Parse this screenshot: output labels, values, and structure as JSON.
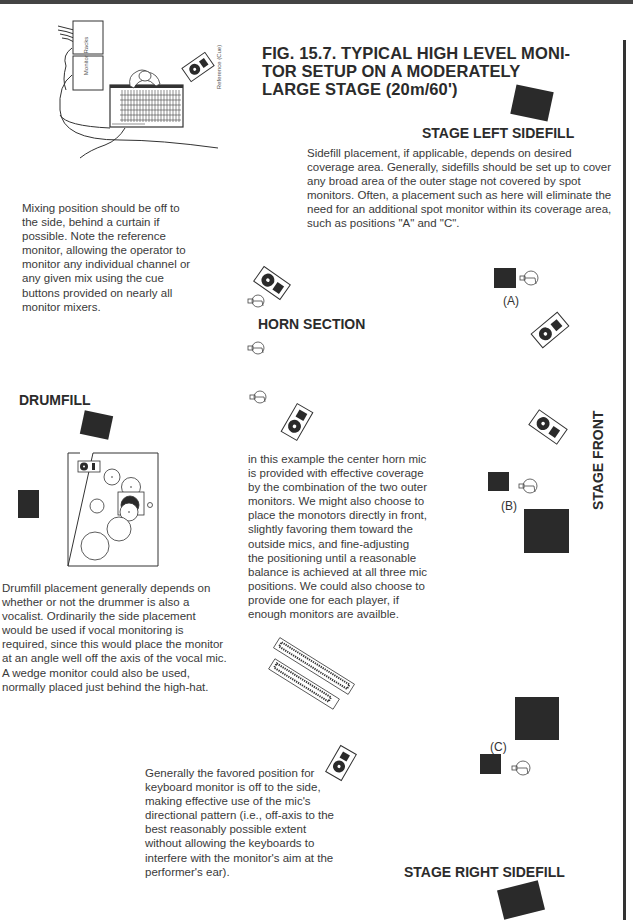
{
  "figure": {
    "title_lines": [
      "FIG. 15.7.  TYPICAL HIGH LEVEL MONI-",
      "TOR SETUP ON A MODERATELY",
      "LARGE STAGE (20m/60')"
    ]
  },
  "mix_position": {
    "rack_label": "Monitor Racks",
    "reference_label": "Reference (Cue)",
    "caption": "Mixing position should be off to the side, behind a curtain if possible.  Note the reference monitor, allowing the operator to monitor any individual channel or any given mix using the cue buttons provided on nearly all monitor mixers."
  },
  "stage_left_sidefill": {
    "label": "STAGE LEFT SIDEFILL",
    "caption": "Sidefill placement, if applicable, depends on desired coverage area.  Generally, sidefills should be set up to cover any broad area of the outer stage not covered by spot monitors.  Often, a placement such as here will eliminate the need for an additional spot monitor within its coverage area, such as positions \"A\" and \"C\"."
  },
  "horn_section": {
    "label": "HORN SECTION",
    "caption": "in this example the center horn mic is provided with effective coverage by the combination of the two outer monitors.  We might also choose to place the monotors directly in front, slightly favoring them toward the outside mics, and fine-adjusting the positioning until a reasonable balance is achieved at all three mic positions.  We could also choose to provide one for each player, if enough monitors are availble."
  },
  "drumfill": {
    "label": "DRUMFILL",
    "caption": "Drumfill placement generally depends on whether or not the drummer is also a vocalist.  Ordinarily the side placement would be used if vocal monitoring is required, since this would place the monitor at an angle well off the axis of the vocal mic.  A wedge monitor could also be used, normally placed just behind the high-hat."
  },
  "keyboards": {
    "caption": "Generally the favored position for keyboard monitor is off to the side, making effective use of the mic's directional pattern (i.e., off-axis to the best reasonably possible extent without allowing the keyboards to interfere with the monitor's aim at the performer's ear)."
  },
  "positions": {
    "a": "(A)",
    "b": "(B)",
    "c": "(C)"
  },
  "stage_right_sidefill": {
    "label": "STAGE RIGHT SIDEFILL"
  },
  "stage_front": {
    "label": "STAGE FRONT"
  },
  "colors": {
    "ink": "#2a2a2a",
    "text": "#3a3a3a",
    "paper": "#ffffff"
  }
}
